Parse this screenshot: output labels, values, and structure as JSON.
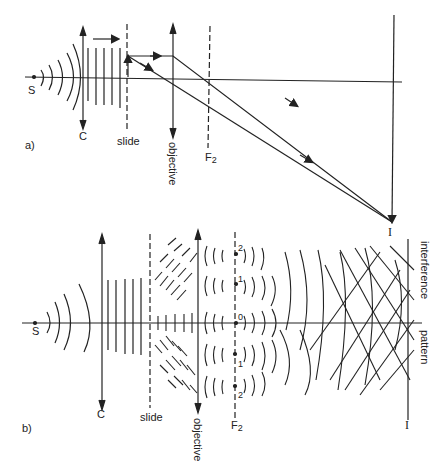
{
  "diagram_a": {
    "panel_label": "a)",
    "labels": {
      "source": "S",
      "condenser": "C",
      "slide": "slide",
      "objective": "objective",
      "focal_plane": "F",
      "focal_sub": "2",
      "image": "I"
    }
  },
  "diagram_b": {
    "panel_label": "b)",
    "labels": {
      "source": "S",
      "condenser": "C",
      "slide": "slide",
      "objective": "objective",
      "focal_plane": "F",
      "focal_sub": "2",
      "image": "I",
      "interference": "interference",
      "pattern": "pattern"
    },
    "orders": [
      "2",
      "1",
      "0",
      "1",
      "2"
    ]
  },
  "colors": {
    "ink": "#222222",
    "background": "#ffffff"
  }
}
